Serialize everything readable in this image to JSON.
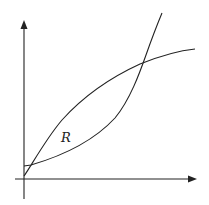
{
  "figure": {
    "region_label": "R",
    "stroke_color": "#222222",
    "background": "#ffffff",
    "axes": {
      "x_axis": "horizontal with arrow",
      "y_axis": "vertical with arrow",
      "tick_labels": []
    },
    "curves": [
      {
        "name": "concave-curve",
        "shape": "increasing, concave down"
      },
      {
        "name": "convex-curve",
        "shape": "increasing, concave up"
      }
    ],
    "intersections": 2
  }
}
